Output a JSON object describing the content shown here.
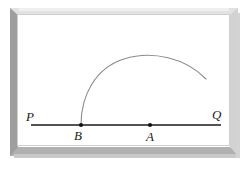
{
  "figure": {
    "background_color": "#ffffff",
    "ink_color": "#1a1a1a",
    "arc_color": "#8c8c8c",
    "frame": {
      "name": "beveled-picture-frame",
      "top_color": "#e2e2e2",
      "left_color": "#9e9e9e",
      "right_color": "#d2d2d2",
      "bottom_color": "#b0b0b0",
      "shadow_color": "#c9c9c9"
    },
    "labels": {
      "P": "P",
      "Q": "Q",
      "A": "A",
      "B": "B"
    },
    "geometry": {
      "line": {
        "name": "line-PQ",
        "x1": 31,
        "y1": 125,
        "x2": 221,
        "y2": 125
      },
      "point_B": {
        "x": 81,
        "y": 125
      },
      "point_A": {
        "x": 150,
        "y": 125
      },
      "arc": {
        "name": "arc-from-B",
        "start": {
          "x": 81,
          "y": 125
        },
        "apex": {
          "x": 150,
          "y": 57
        },
        "end": {
          "x": 206,
          "y": 79
        }
      }
    }
  }
}
